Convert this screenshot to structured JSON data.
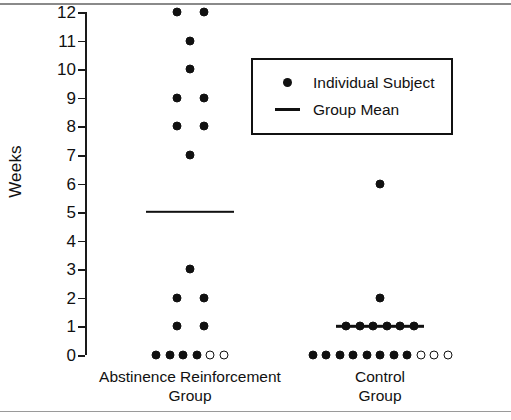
{
  "chart_data": {
    "type": "scatter",
    "title": "",
    "subtitle": "",
    "xlabel": "",
    "ylabel": "Weeks",
    "ylim": [
      0,
      12
    ],
    "yticks": [
      0,
      1,
      2,
      3,
      4,
      5,
      6,
      7,
      8,
      9,
      10,
      11,
      12
    ],
    "ytick_labels": [
      "0",
      "1",
      "2",
      "3",
      "4",
      "5",
      "6",
      "7",
      "8",
      "9",
      "10",
      "11",
      "12"
    ],
    "grid": false,
    "legend_position": "upper-right",
    "legend": [
      {
        "marker": "filled-dot",
        "label": "Individual Subject"
      },
      {
        "marker": "horizontal-line",
        "label": "Group Mean"
      }
    ],
    "categories": [
      "Abstinence Reinforcement Group",
      "Control Group"
    ],
    "series": [
      {
        "name": "Abstinence Reinforcement Group",
        "category_label_line1": "Abstinence Reinforcement",
        "category_label_line2": "Group",
        "group_mean": 5,
        "n_filled": 15,
        "n_open": 2,
        "points": [
          {
            "value": 12,
            "filled": true,
            "offset": -1
          },
          {
            "value": 12,
            "filled": true,
            "offset": 1
          },
          {
            "value": 11,
            "filled": true,
            "offset": 0
          },
          {
            "value": 10,
            "filled": true,
            "offset": 0
          },
          {
            "value": 9,
            "filled": true,
            "offset": -1
          },
          {
            "value": 9,
            "filled": true,
            "offset": 1
          },
          {
            "value": 8,
            "filled": true,
            "offset": -1
          },
          {
            "value": 8,
            "filled": true,
            "offset": 1
          },
          {
            "value": 7,
            "filled": true,
            "offset": 0
          },
          {
            "value": 3,
            "filled": true,
            "offset": 0
          },
          {
            "value": 2,
            "filled": true,
            "offset": -1
          },
          {
            "value": 2,
            "filled": true,
            "offset": 1
          },
          {
            "value": 1,
            "filled": true,
            "offset": -1
          },
          {
            "value": 1,
            "filled": true,
            "offset": 1
          },
          {
            "value": 0,
            "filled": true,
            "offset": -2.5
          },
          {
            "value": 0,
            "filled": true,
            "offset": -1.5
          },
          {
            "value": 0,
            "filled": true,
            "offset": -0.5
          },
          {
            "value": 0,
            "filled": true,
            "offset": 0.5
          },
          {
            "value": 0,
            "filled": false,
            "offset": 1.5
          },
          {
            "value": 0,
            "filled": false,
            "offset": 2.5
          }
        ]
      },
      {
        "name": "Control Group",
        "category_label_line1": "Control",
        "category_label_line2": "Group",
        "group_mean": 1,
        "n_filled": 16,
        "n_open": 3,
        "points": [
          {
            "value": 6,
            "filled": true,
            "offset": 0
          },
          {
            "value": 2,
            "filled": true,
            "offset": 0
          },
          {
            "value": 1,
            "filled": true,
            "offset": -2.5
          },
          {
            "value": 1,
            "filled": true,
            "offset": -1.5
          },
          {
            "value": 1,
            "filled": true,
            "offset": -0.5
          },
          {
            "value": 1,
            "filled": true,
            "offset": 0.5
          },
          {
            "value": 1,
            "filled": true,
            "offset": 1.5
          },
          {
            "value": 1,
            "filled": true,
            "offset": 2.5
          },
          {
            "value": 0,
            "filled": true,
            "offset": -5
          },
          {
            "value": 0,
            "filled": true,
            "offset": -4
          },
          {
            "value": 0,
            "filled": true,
            "offset": -3
          },
          {
            "value": 0,
            "filled": true,
            "offset": -2
          },
          {
            "value": 0,
            "filled": true,
            "offset": -1
          },
          {
            "value": 0,
            "filled": true,
            "offset": 0
          },
          {
            "value": 0,
            "filled": true,
            "offset": 1
          },
          {
            "value": 0,
            "filled": true,
            "offset": 2
          },
          {
            "value": 0,
            "filled": false,
            "offset": 3
          },
          {
            "value": 0,
            "filled": false,
            "offset": 4
          },
          {
            "value": 0,
            "filled": false,
            "offset": 5
          }
        ]
      }
    ]
  },
  "colors": {
    "marker": "#111111",
    "axis": "#1a1a1a",
    "background": "#ffffff",
    "rule": "#8a8a8a"
  }
}
